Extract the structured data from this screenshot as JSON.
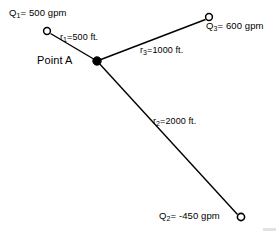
{
  "figure": {
    "type": "pipe-network-node-diagram",
    "width": 279,
    "height": 238,
    "background": "#ffffff",
    "line_color": "#000000",
    "node_fill_open": "#ffffff",
    "node_fill_solid": "#000000"
  },
  "center_node": {
    "label": "Point A",
    "x": 97,
    "y": 61,
    "style": "filled-circle"
  },
  "nodes": [
    {
      "id": "node-q1",
      "label_q": "Q",
      "label_sub": "1",
      "label_rest": "= 500 gpm",
      "full_label": "Q1= 500 gpm",
      "value": 500,
      "units": "gpm",
      "x": 47,
      "y": 31,
      "style": "open-circle"
    },
    {
      "id": "node-q3",
      "label_q": "Q",
      "label_sub": "3",
      "label_rest": "= 600 gpm",
      "full_label": "Q3= 600 gpm",
      "value": 600,
      "units": "gpm",
      "x": 209,
      "y": 17,
      "style": "open-circle"
    },
    {
      "id": "node-q2",
      "label_q": "Q",
      "label_sub": "2",
      "label_rest": "= -450 gpm",
      "full_label": "Q2= -450 gpm",
      "value": -450,
      "units": "gpm",
      "x": 241,
      "y": 217,
      "style": "open-circle"
    }
  ],
  "pipes": [
    {
      "id": "pipe-r1",
      "label_r": "r",
      "label_sub": "1",
      "label_rest": "=500 ft.",
      "full_label": "r1=500 ft.",
      "length": 500,
      "units": "ft.",
      "from": "Point A",
      "to": "Q1"
    },
    {
      "id": "pipe-r3",
      "label_r": "r",
      "label_sub": "3",
      "label_rest": "=1000 ft.",
      "full_label": "r3=1000 ft.",
      "length": 1000,
      "units": "ft.",
      "from": "Point A",
      "to": "Q3"
    },
    {
      "id": "pipe-r2",
      "label_r": "r",
      "label_sub": "2",
      "label_rest": "=2000 ft.",
      "full_label": "r2=2000 ft.",
      "length": 2000,
      "units": "ft.",
      "from": "Point A",
      "to": "Q2"
    }
  ]
}
